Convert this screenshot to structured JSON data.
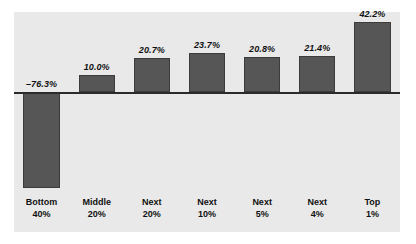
{
  "chart_data": {
    "type": "bar",
    "title": "",
    "subtitle": "",
    "xlabel": "",
    "ylabel": "",
    "grid": false,
    "legend": "none",
    "zero_line": true,
    "categories": [
      {
        "line1": "Bottom",
        "line2": "40%"
      },
      {
        "line1": "Middle",
        "line2": "20%"
      },
      {
        "line1": "Next",
        "line2": "20%"
      },
      {
        "line1": "Next",
        "line2": "10%"
      },
      {
        "line1": "Next",
        "line2": "5%"
      },
      {
        "line1": "Next",
        "line2": "4%"
      },
      {
        "line1": "Top",
        "line2": "1%"
      }
    ],
    "values": [
      -76.3,
      10.0,
      20.7,
      23.7,
      20.8,
      21.4,
      42.2
    ],
    "value_labels": [
      "–76.3%",
      "10.0%",
      "20.7%",
      "23.7%",
      "20.8%",
      "21.4%",
      "42.2%"
    ],
    "ylim": [
      -80,
      48
    ],
    "units": "percent"
  },
  "style": {
    "bar_fill": "#565656",
    "bar_border": "#3c3c3c",
    "panel_bg": "#e9e9e9",
    "page_bg": "#ffffff",
    "axis_color": "#2b2b2b",
    "label_color": "#111111"
  }
}
